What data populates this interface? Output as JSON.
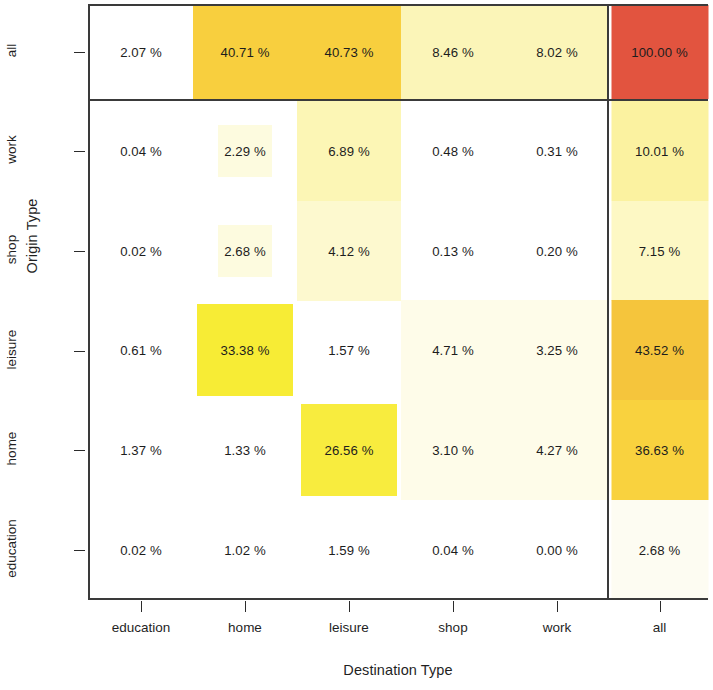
{
  "axes": {
    "y_title": "Origin Type",
    "x_title": "Destination Type",
    "y_ticks": [
      "all",
      "work",
      "shop",
      "leisure",
      "home",
      "education"
    ],
    "x_ticks": [
      "education",
      "home",
      "leisure",
      "shop",
      "work",
      "all"
    ]
  },
  "chart_data": {
    "type": "heatmap",
    "title": "",
    "xlabel": "Destination Type",
    "ylabel": "Origin Type",
    "x_categories": [
      "education",
      "home",
      "leisure",
      "shop",
      "work",
      "all"
    ],
    "y_categories": [
      "all",
      "work",
      "shop",
      "leisure",
      "home",
      "education"
    ],
    "value_unit": "%",
    "grid": false,
    "legend": "none",
    "note": "Rows top-to-bottom; the 'all' row and 'all' column are margin totals separated by rule lines.",
    "rows": [
      {
        "origin": "all",
        "cells": [
          {
            "destination": "education",
            "value": 2.07,
            "label": "2.07 %",
            "color": "#fdfcf3",
            "fill": 0.06
          },
          {
            "destination": "home",
            "value": 40.71,
            "label": "40.71 %",
            "color": "#f8cf3e",
            "fill": 1.0
          },
          {
            "destination": "leisure",
            "value": 40.73,
            "label": "40.73 %",
            "color": "#f8cf3e",
            "fill": 1.0
          },
          {
            "destination": "shop",
            "value": 8.46,
            "label": "8.46 %",
            "color": "#fbf5b8",
            "fill": 1.0
          },
          {
            "destination": "work",
            "value": 8.02,
            "label": "8.02 %",
            "color": "#fbf5b8",
            "fill": 1.0
          },
          {
            "destination": "all",
            "value": 100.0,
            "label": "100.00 %",
            "color": "#e2543f",
            "fill": 1.0
          }
        ]
      },
      {
        "origin": "work",
        "cells": [
          {
            "destination": "education",
            "value": 0.04,
            "label": "0.04 %",
            "color": "#ffffff",
            "fill": 0.0
          },
          {
            "destination": "home",
            "value": 2.29,
            "label": "2.29 %",
            "color": "#fdfbdf",
            "fill": 0.52
          },
          {
            "destination": "leisure",
            "value": 6.89,
            "label": "6.89 %",
            "color": "#fcf6b5",
            "fill": 1.0
          },
          {
            "destination": "shop",
            "value": 0.48,
            "label": "0.48 %",
            "color": "#ffffff",
            "fill": 0.0
          },
          {
            "destination": "work",
            "value": 0.31,
            "label": "0.31 %",
            "color": "#ffffff",
            "fill": 0.0
          },
          {
            "destination": "all",
            "value": 10.01,
            "label": "10.01 %",
            "color": "#fbf2a0",
            "fill": 1.0
          }
        ]
      },
      {
        "origin": "shop",
        "cells": [
          {
            "destination": "education",
            "value": 0.02,
            "label": "0.02 %",
            "color": "#ffffff",
            "fill": 0.0
          },
          {
            "destination": "home",
            "value": 2.68,
            "label": "2.68 %",
            "color": "#fdfbdf",
            "fill": 0.52
          },
          {
            "destination": "leisure",
            "value": 4.12,
            "label": "4.12 %",
            "color": "#fdf9cf",
            "fill": 1.0
          },
          {
            "destination": "shop",
            "value": 0.13,
            "label": "0.13 %",
            "color": "#ffffff",
            "fill": 0.0
          },
          {
            "destination": "work",
            "value": 0.2,
            "label": "0.20 %",
            "color": "#ffffff",
            "fill": 0.0
          },
          {
            "destination": "all",
            "value": 7.15,
            "label": "7.15 %",
            "color": "#fdf8c4",
            "fill": 1.0
          }
        ]
      },
      {
        "origin": "leisure",
        "cells": [
          {
            "destination": "education",
            "value": 0.61,
            "label": "0.61 %",
            "color": "#ffffff",
            "fill": 0.0
          },
          {
            "destination": "home",
            "value": 33.38,
            "label": "33.38 %",
            "color": "#f7ec35",
            "fill": 0.92
          },
          {
            "destination": "leisure",
            "value": 1.57,
            "label": "1.57 %",
            "color": "#ffffff",
            "fill": 0.0
          },
          {
            "destination": "shop",
            "value": 4.71,
            "label": "4.71 %",
            "color": "#fefce9",
            "fill": 1.0
          },
          {
            "destination": "work",
            "value": 3.25,
            "label": "3.25 %",
            "color": "#fefce9",
            "fill": 1.0
          },
          {
            "destination": "all",
            "value": 43.52,
            "label": "43.52 %",
            "color": "#f5c53c",
            "fill": 1.0
          }
        ]
      },
      {
        "origin": "home",
        "cells": [
          {
            "destination": "education",
            "value": 1.37,
            "label": "1.37 %",
            "color": "#ffffff",
            "fill": 0.0
          },
          {
            "destination": "home",
            "value": 1.33,
            "label": "1.33 %",
            "color": "#ffffff",
            "fill": 0.0
          },
          {
            "destination": "leisure",
            "value": 26.56,
            "label": "26.56 %",
            "color": "#f8ec3e",
            "fill": 0.92
          },
          {
            "destination": "shop",
            "value": 3.1,
            "label": "3.10 %",
            "color": "#fefce9",
            "fill": 1.0
          },
          {
            "destination": "work",
            "value": 4.27,
            "label": "4.27 %",
            "color": "#fefce9",
            "fill": 1.0
          },
          {
            "destination": "all",
            "value": 36.63,
            "label": "36.63 %",
            "color": "#f9d23e",
            "fill": 1.0
          }
        ]
      },
      {
        "origin": "education",
        "cells": [
          {
            "destination": "education",
            "value": 0.02,
            "label": "0.02 %",
            "color": "#ffffff",
            "fill": 0.0
          },
          {
            "destination": "home",
            "value": 1.02,
            "label": "1.02 %",
            "color": "#ffffff",
            "fill": 0.0
          },
          {
            "destination": "leisure",
            "value": 1.59,
            "label": "1.59 %",
            "color": "#ffffff",
            "fill": 0.0
          },
          {
            "destination": "shop",
            "value": 0.04,
            "label": "0.04 %",
            "color": "#ffffff",
            "fill": 0.0
          },
          {
            "destination": "work",
            "value": 0.0,
            "label": "0.00 %",
            "color": "#ffffff",
            "fill": 0.0
          },
          {
            "destination": "all",
            "value": 2.68,
            "label": "2.68 %",
            "color": "#fdfcf2",
            "fill": 1.0
          }
        ]
      }
    ]
  }
}
